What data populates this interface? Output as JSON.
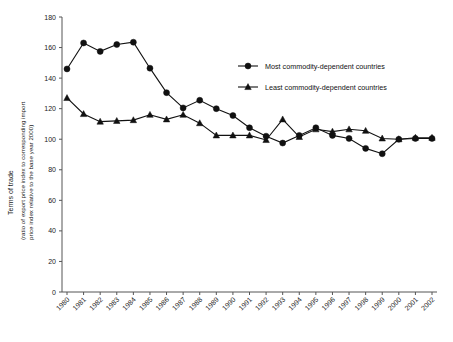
{
  "chart_data": {
    "type": "line",
    "title": "",
    "xlabel": "",
    "ylabel": "Terms of trade",
    "ylabel_sub_line1": "(ratio of export price index to corresponding import",
    "ylabel_sub_line2": "price index relative to the base year 2000)",
    "grid": false,
    "legend_position": "top-right",
    "ylim": [
      0,
      180
    ],
    "yticks": [
      0,
      20,
      40,
      60,
      80,
      100,
      120,
      140,
      160,
      180
    ],
    "categories": [
      "1980",
      "1981",
      "1982",
      "1983",
      "1984",
      "1985",
      "1986",
      "1987",
      "1988",
      "1989",
      "1990",
      "1991",
      "1992",
      "1993",
      "1994",
      "1995",
      "1996",
      "1997",
      "1998",
      "1999",
      "2000",
      "2001",
      "2002"
    ],
    "series": [
      {
        "name": "Most commodity-dependent countries",
        "marker": "circle",
        "values": [
          146,
          163,
          157.5,
          162,
          163.5,
          146.5,
          130.5,
          120.5,
          125.5,
          120,
          115.5,
          107.5,
          102,
          97.5,
          102.5,
          107.5,
          102.5,
          100.5,
          94,
          90.5,
          100,
          100.5,
          100.5
        ]
      },
      {
        "name": "Least commodity-dependent countries",
        "marker": "triangle",
        "values": [
          127,
          116.5,
          111.5,
          112,
          112.5,
          116,
          113,
          116,
          110.5,
          102.5,
          102.5,
          102.5,
          99.5,
          113,
          101.5,
          106.5,
          105,
          106.5,
          105.5,
          100.5,
          100,
          101,
          101
        ]
      }
    ]
  },
  "legend": {
    "items": [
      {
        "label": "Most commodity-dependent countries",
        "marker": "circle"
      },
      {
        "label": "Least commodity-dependent countries",
        "marker": "triangle"
      }
    ]
  },
  "colors": {
    "series": "#111111",
    "axis": "#555555",
    "background": "#ffffff"
  }
}
